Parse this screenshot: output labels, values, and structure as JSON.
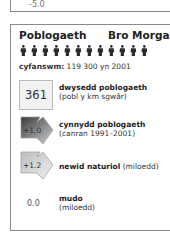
{
  "top_panel": {
    "value": "-5.0"
  },
  "panel": {
    "title": "Poblogaeth",
    "region": "Bro Morgannwg",
    "people_icon_count": 12,
    "total_label": "cyfanswm:",
    "total_value": "119 300 yn 2001",
    "rows": [
      {
        "value": "361",
        "label": "dwysedd poblogaeth",
        "sublabel": "(pobl y km sgwâr)",
        "icon": "square-box"
      },
      {
        "value": "+1.0",
        "label": "cynnydd poblogaeth",
        "sublabel": "(canran 1991–2001)",
        "icon": "arrow-up-right-dark"
      },
      {
        "value": "+1.2",
        "label": "newid naturiol",
        "sublabel_inline": "(miloedd)",
        "icon": "arrow-up-right-light"
      },
      {
        "value": "0.0",
        "label": "mudo",
        "sublabel": "(miloedd)",
        "icon": "none"
      }
    ]
  },
  "colors": {
    "border": "#8a8a8a",
    "person": "#2a2a2a",
    "arrow_dark": "#555555",
    "arrow_light": "#cccccc"
  }
}
